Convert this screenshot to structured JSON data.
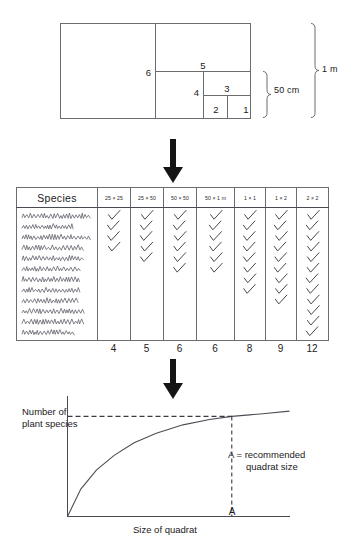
{
  "quadrat_diagram": {
    "name": "nested-quadrat-diagram",
    "nested_labels": [
      "1",
      "2",
      "3",
      "4",
      "5",
      "6"
    ],
    "dimension_labels": {
      "height_total": "1 m",
      "height_half": "50 cm"
    }
  },
  "flow": {
    "arrow1_name": "down-arrow-icon",
    "arrow2_name": "down-arrow-icon"
  },
  "species_table": {
    "species_header": "Species",
    "size_headers": [
      "25 × 25",
      "25 × 50",
      "50 × 50",
      "50 × 1 m",
      "1 × 1",
      "1 × 2",
      "2 × 2"
    ],
    "row_count": 12,
    "check_counts": [
      4,
      5,
      6,
      6,
      8,
      9,
      12
    ],
    "totals": [
      "4",
      "5",
      "6",
      "6",
      "8",
      "9",
      "12"
    ],
    "check_glyph": "✓"
  },
  "chart_data": {
    "type": "line",
    "title": "",
    "xlabel": "Size of quadrat",
    "ylabel": "Number of plant species",
    "x": [
      0,
      0.06,
      0.13,
      0.21,
      0.3,
      0.4,
      0.52,
      0.64,
      0.74,
      0.82,
      0.88,
      1.0
    ],
    "y": [
      0,
      0.26,
      0.44,
      0.58,
      0.7,
      0.79,
      0.87,
      0.92,
      0.95,
      0.965,
      0.975,
      1.0
    ],
    "xlim": [
      0,
      1
    ],
    "ylim": [
      0,
      1.12
    ],
    "grid": false,
    "legend": "none",
    "annotations": {
      "a_point_label": "A",
      "a_point_x": 0.74,
      "a_point_y": 0.95,
      "note_line1": "A  =  recommended",
      "note_line2": "quadrat size",
      "guide_lines": [
        "horizontal dashed from y-axis to A",
        "vertical dashed from A to x-axis"
      ]
    },
    "axis_ticks": {
      "x": [
        "A"
      ],
      "y": []
    }
  },
  "colors": {
    "ink": "#1a1a1a",
    "rule": "#6b6b72",
    "curve": "#4d4d55",
    "dash": "#3a3a42",
    "background": "#ffffff"
  }
}
